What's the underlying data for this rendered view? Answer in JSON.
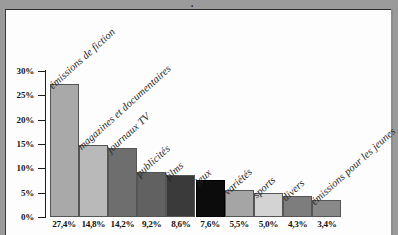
{
  "figure": {
    "frame_color": "#9b9b9b",
    "panel_color": "#fdfdfd",
    "title_fragment": "."
  },
  "axis": {
    "y_ticks": [
      "30%",
      "25%",
      "20%",
      "15%",
      "10%",
      "5%",
      "0%"
    ],
    "y_min": 0,
    "y_max": 30
  },
  "chart_data": {
    "type": "bar",
    "title": "",
    "xlabel": "",
    "ylabel": "",
    "ylim": [
      0,
      30
    ],
    "grid": false,
    "legend": "none",
    "axis_tick_labels": [
      "30%",
      "25%",
      "20%",
      "15%",
      "10%",
      "5%",
      "0%"
    ],
    "categories": [
      "émissions de fiction",
      "magazines et documentaires",
      "journaux TV",
      "publicités",
      "films",
      "jeux",
      "variétés",
      "sports",
      "divers",
      "émissions pour les jeunes"
    ],
    "values": [
      27.4,
      14.8,
      14.2,
      9.2,
      8.6,
      7.6,
      5.5,
      5.0,
      4.3,
      3.4
    ],
    "value_labels": [
      "27,4%",
      "14,8%",
      "14,2%",
      "9,2%",
      "8,6%",
      "7,6%",
      "5,5%",
      "5,0%",
      "4,3%",
      "3,4%"
    ],
    "bar_colors": [
      "#a9a9a9",
      "#b9b9b9",
      "#6e6e6e",
      "#616161",
      "#3a3a3a",
      "#0c0c0c",
      "#a5a5a5",
      "#d3d3d3",
      "#7d7d7d",
      "#898989"
    ]
  }
}
